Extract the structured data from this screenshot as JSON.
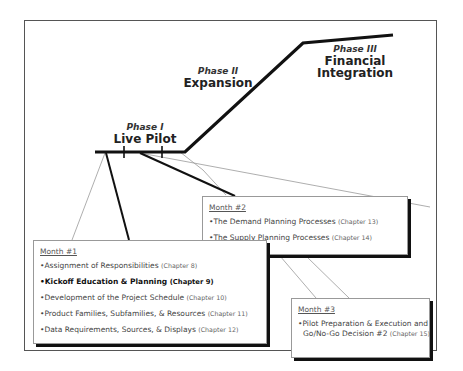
{
  "phases": [
    {
      "number": "Phase I",
      "name_lines": [
        "Live Pilot"
      ]
    },
    {
      "number": "Phase II",
      "name_lines": [
        "Expansion"
      ]
    },
    {
      "number": "Phase III",
      "name_lines": [
        "Financial",
        "Integration"
      ]
    }
  ],
  "months": [
    {
      "title": "Month #1",
      "items": [
        {
          "text": "Assignment of Responsibilities",
          "chapter": "(Chapter 8)",
          "bold": false
        },
        {
          "text": "Kickoff Education & Planning",
          "chapter": "(Chapter 9)",
          "bold": true
        },
        {
          "text": "Development of the Project Schedule",
          "chapter": "(Chapter 10)",
          "bold": false
        },
        {
          "text": "Product Families, Subfamilies, & Resources",
          "chapter": "(Chapter 11)",
          "bold": false
        },
        {
          "text": "Data Requirements, Sources, & Displays",
          "chapter": "(Chapter 12)",
          "bold": false
        }
      ]
    },
    {
      "title": "Month #2",
      "items": [
        {
          "text": "The Demand Planning Processes",
          "chapter": "(Chapter 13)",
          "bold": false
        },
        {
          "text": "The Supply Planning Processes",
          "chapter": "(Chapter 14)",
          "bold": false
        }
      ]
    },
    {
      "title": "Month #3",
      "items": [
        {
          "text": "Pilot Preparation & Execution and",
          "text2": "Go/No-Go Decision #2",
          "chapter": "(Chapter 15)",
          "bold": false
        }
      ]
    }
  ],
  "bullet": "•",
  "colors": {
    "line": "#111111",
    "thin_line": "#999999",
    "frame": "#555555",
    "shadow": "#111111"
  }
}
